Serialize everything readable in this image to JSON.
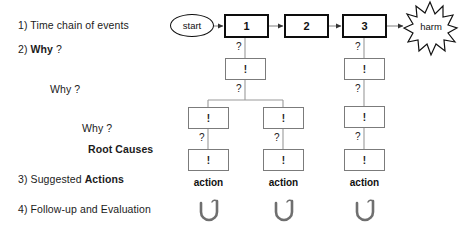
{
  "diagram": {
    "title_steps": [
      {
        "id": "step1",
        "text_plain": "1) Time chain of events",
        "left": 18,
        "top": 24
      },
      {
        "id": "step2",
        "pre": "2) ",
        "bold": "Why",
        "post": " ?",
        "left": 18,
        "top": 48
      },
      {
        "id": "why2",
        "text_plain": "Why ?",
        "left": 50,
        "top": 88
      },
      {
        "id": "why3",
        "text_plain": "Why ?",
        "left": 82,
        "top": 128
      },
      {
        "id": "rootcauses",
        "bold": "Root Causes",
        "left": 86,
        "top": 148
      },
      {
        "id": "step3",
        "pre": "3) Suggested ",
        "bold": "Actions",
        "left": 18,
        "top": 178
      },
      {
        "id": "step4",
        "text_plain": "4) Follow-up and Evaluation",
        "left": 18,
        "top": 208
      }
    ],
    "start_node": {
      "label": "start"
    },
    "harm_node": {
      "label": "harm"
    },
    "chain": [
      {
        "label": "1"
      },
      {
        "label": "2"
      },
      {
        "label": "3"
      }
    ],
    "why_mark": "?",
    "cause_mark": "!",
    "action_label": "action",
    "actions": [
      {
        "label": "action"
      },
      {
        "label": "action"
      },
      {
        "label": "action"
      }
    ],
    "cause_boxes": {
      "col_a": [
        "!",
        "!",
        "!"
      ],
      "col_b": [
        "!",
        "!"
      ],
      "col_c": [
        "!",
        "!",
        "!"
      ]
    },
    "why_marks": [
      "?",
      "?",
      "?",
      "?",
      "?",
      "?",
      "?"
    ],
    "colors": {
      "ink": "#0d0d0d",
      "thin_border": "#7b7b7b",
      "connector": "#8a8a8a",
      "text": "#1b1b1b",
      "background": "#ffffff"
    }
  }
}
